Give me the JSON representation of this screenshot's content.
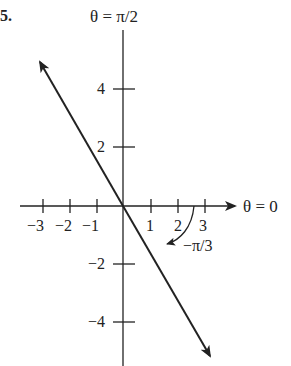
{
  "problem_number": "5.",
  "axes": {
    "vertical_label": "θ = π/2",
    "horizontal_label": "θ = 0"
  },
  "x_ticks": [
    "−3",
    "−2",
    "−1",
    "1",
    "2",
    "3"
  ],
  "y_ticks": [
    "4",
    "2",
    "−2",
    "−4"
  ],
  "angle_label": "−π/3",
  "line": {
    "description": "line through origin at angle −π/3",
    "angle": "−π/3"
  }
}
